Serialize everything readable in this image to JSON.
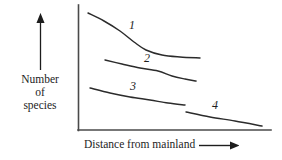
{
  "chart_data": {
    "type": "line",
    "title": "",
    "xlabel": "Distance from mainland",
    "ylabel": "Number of species",
    "ylabel_lines": [
      "Number",
      "of",
      "species"
    ],
    "axes": {
      "x_arrow": true,
      "y_arrow": true,
      "ticks": false,
      "grid": false,
      "tick_labels": []
    },
    "annotations": [
      {
        "label": "1",
        "x": 132,
        "y": 29
      },
      {
        "label": "2",
        "x": 147,
        "y": 62
      },
      {
        "label": "3",
        "x": 133,
        "y": 90
      },
      {
        "label": "4",
        "x": 215,
        "y": 109
      }
    ],
    "series": [
      {
        "name": "1",
        "label": "1",
        "comment": "steeply declining curve, highest of the four",
        "points": [
          [
            88,
            13
          ],
          [
            104,
            21
          ],
          [
            120,
            31
          ],
          [
            134,
            42
          ],
          [
            146,
            50
          ],
          [
            162,
            55
          ],
          [
            180,
            57
          ],
          [
            200,
            58
          ]
        ]
      },
      {
        "name": "2",
        "label": "2",
        "comment": "gently declining curve, second highest",
        "points": [
          [
            105,
            60
          ],
          [
            122,
            64
          ],
          [
            140,
            68
          ],
          [
            158,
            71
          ],
          [
            172,
            76
          ],
          [
            185,
            79
          ],
          [
            196,
            81
          ]
        ]
      },
      {
        "name": "3",
        "label": "3",
        "comment": "shallow declining line, third band",
        "points": [
          [
            90,
            88
          ],
          [
            110,
            93
          ],
          [
            130,
            97
          ],
          [
            150,
            100
          ],
          [
            168,
            103
          ],
          [
            185,
            105
          ]
        ]
      },
      {
        "name": "4",
        "label": "4",
        "comment": "lowest short declining segment at far right",
        "points": [
          [
            186,
            112
          ],
          [
            210,
            117
          ],
          [
            235,
            121
          ],
          [
            262,
            126
          ]
        ]
      }
    ]
  },
  "style": {
    "background": "#ffffff",
    "line_color": "#2b2b2b",
    "axis_color": "#4a4a4a",
    "text_color": "#1d1d1d"
  }
}
